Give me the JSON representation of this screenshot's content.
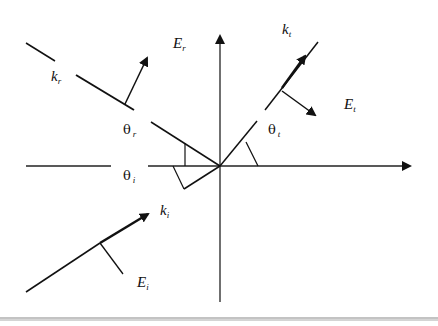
{
  "diagram": {
    "type": "reflection-refraction",
    "labels": {
      "E_r": {
        "main": "E",
        "sub": "r"
      },
      "k_r": {
        "main": "k",
        "sub": "r"
      },
      "k_t": {
        "main": "k",
        "sub": "t"
      },
      "E_t": {
        "main": "E",
        "sub": "t"
      },
      "theta_r": {
        "main": "θ",
        "sub": "r"
      },
      "theta_t": {
        "main": "θ",
        "sub": "t"
      },
      "theta_i": {
        "main": "θ",
        "sub": "i"
      },
      "k_i": {
        "main": "k",
        "sub": "i"
      },
      "E_i": {
        "main": "E",
        "sub": "i"
      }
    },
    "colors": {
      "stroke": "#111111",
      "rule": "#888888",
      "background": "#ffffff"
    }
  }
}
